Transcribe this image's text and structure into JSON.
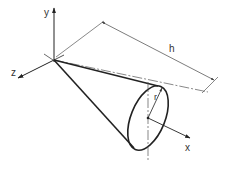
{
  "diagram": {
    "shape": "right circular cone",
    "labels": {
      "y_axis": "y",
      "z_axis": "z",
      "x_axis": "x",
      "height": "h",
      "radius": "r"
    },
    "colors": {
      "line": "#222222",
      "thin_line": "#555555",
      "background": "#ffffff"
    }
  }
}
